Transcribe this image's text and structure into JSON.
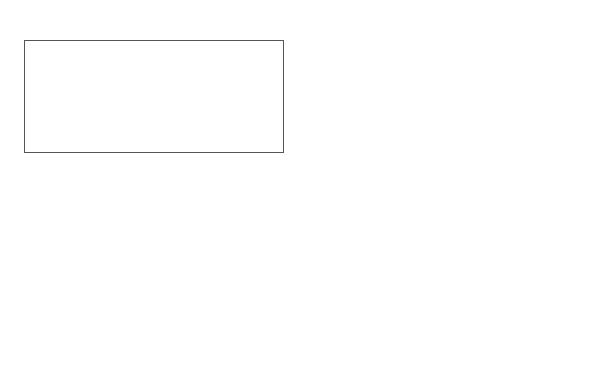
{
  "organization": {
    "title": "Organization",
    "footer": "Responsive",
    "boxes": [
      "Assets\nand\nresources",
      "Structure",
      "Strategies"
    ]
  },
  "environment": {
    "title": "Environment",
    "footer": "Dynamic",
    "boxes": [
      "Opportunities\nand\nthreats",
      "Complexity",
      "Competitors/\nmarkets"
    ]
  },
  "connections": [
    {
      "from": "Assets and resources",
      "to": "Opportunities and threats",
      "type": "bidirectional"
    },
    {
      "from": "Structure",
      "to": "Complexity",
      "type": "bidirectional"
    },
    {
      "from": "Strategies",
      "to": "Competitors/markets",
      "type": "bidirectional"
    }
  ]
}
